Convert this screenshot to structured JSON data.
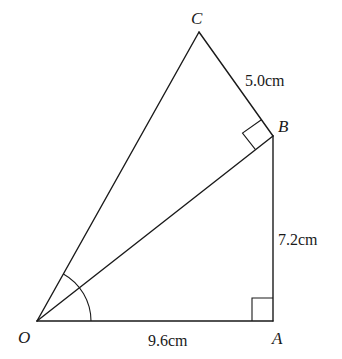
{
  "diagram": {
    "type": "geometry",
    "colors": {
      "stroke": "#1a1a1a",
      "background": "#ffffff"
    },
    "points": {
      "O": {
        "label": "O",
        "x": 37,
        "y": 321
      },
      "A": {
        "label": "A",
        "x": 273,
        "y": 321
      },
      "B": {
        "label": "B",
        "x": 273,
        "y": 136
      },
      "C": {
        "label": "C",
        "x": 199,
        "y": 32
      }
    },
    "segments": [
      {
        "from": "O",
        "to": "A"
      },
      {
        "from": "A",
        "to": "B"
      },
      {
        "from": "O",
        "to": "B"
      },
      {
        "from": "B",
        "to": "C"
      },
      {
        "from": "O",
        "to": "C"
      }
    ],
    "measurements": {
      "OA": "9.6cm",
      "AB": "7.2cm",
      "BC": "5.0cm"
    },
    "right_angles": [
      "OAB",
      "OBC"
    ],
    "angle_marks": [
      "AOC"
    ]
  }
}
